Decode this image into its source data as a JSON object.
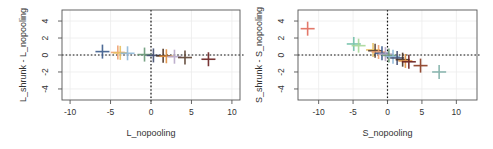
{
  "chart_data": [
    {
      "type": "scatter",
      "marker": "plus",
      "title": "",
      "xlabel": "L_nopooling",
      "ylabel": "L_shrunk - L_nopooling",
      "xlim": [
        -11,
        11
      ],
      "ylim": [
        -5.3,
        5.3
      ],
      "xticks": [
        -10,
        -5,
        0,
        5,
        10
      ],
      "yticks": [
        -4,
        -2,
        0,
        2,
        4
      ],
      "grid": true,
      "reference_lines": {
        "x": 0,
        "y": 0,
        "style": "dotted"
      },
      "points": [
        {
          "x": -6.0,
          "y": 0.4,
          "color": "#3b5b8c"
        },
        {
          "x": -4.1,
          "y": 0.3,
          "color": "#f0a070"
        },
        {
          "x": -3.8,
          "y": 0.25,
          "color": "#e8c060"
        },
        {
          "x": -2.9,
          "y": 0.2,
          "color": "#8fb8d8"
        },
        {
          "x": -0.8,
          "y": 0.05,
          "color": "#6a9a78"
        },
        {
          "x": 0.3,
          "y": -0.05,
          "color": "#404c70"
        },
        {
          "x": 1.5,
          "y": -0.1,
          "color": "#4a3020"
        },
        {
          "x": 1.9,
          "y": -0.15,
          "color": "#e09040"
        },
        {
          "x": 2.9,
          "y": -0.2,
          "color": "#b8a8c8"
        },
        {
          "x": 4.2,
          "y": -0.3,
          "color": "#5a4030"
        },
        {
          "x": 7.1,
          "y": -0.5,
          "color": "#6a2020"
        }
      ]
    },
    {
      "type": "scatter",
      "marker": "plus",
      "title": "",
      "xlabel": "S_nopooling",
      "ylabel": "S_shrunk - S_nopooling",
      "xlim": [
        -13,
        13
      ],
      "ylim": [
        -5.3,
        5.3
      ],
      "xticks": [
        -10,
        -5,
        0,
        5,
        10
      ],
      "yticks": [
        -4,
        -2,
        0,
        2,
        4
      ],
      "grid": true,
      "reference_lines": {
        "x": 0,
        "y": 0,
        "style": "dotted"
      },
      "points": [
        {
          "x": -11.6,
          "y": 3.1,
          "color": "#e06a5a"
        },
        {
          "x": -4.9,
          "y": 1.3,
          "color": "#70c0a8"
        },
        {
          "x": -4.2,
          "y": 1.1,
          "color": "#a8d898"
        },
        {
          "x": -2.1,
          "y": 0.6,
          "color": "#e8c060"
        },
        {
          "x": -1.8,
          "y": 0.5,
          "color": "#5a4030"
        },
        {
          "x": -1.3,
          "y": 0.35,
          "color": "#f0a070"
        },
        {
          "x": -0.8,
          "y": 0.2,
          "color": "#3b5b8c"
        },
        {
          "x": -0.3,
          "y": 0.1,
          "color": "#b8a8c8"
        },
        {
          "x": 0.2,
          "y": -0.05,
          "color": "#6a9a78"
        },
        {
          "x": 0.8,
          "y": -0.2,
          "color": "#8fb8d8"
        },
        {
          "x": 1.4,
          "y": -0.35,
          "color": "#404c70"
        },
        {
          "x": 2.2,
          "y": -0.55,
          "color": "#4a3020"
        },
        {
          "x": 2.6,
          "y": -0.7,
          "color": "#e09040"
        },
        {
          "x": 3.1,
          "y": -0.8,
          "color": "#6a2020"
        },
        {
          "x": 4.8,
          "y": -1.25,
          "color": "#8a3a20"
        },
        {
          "x": 7.5,
          "y": -2.0,
          "color": "#80b0a8"
        }
      ]
    }
  ]
}
